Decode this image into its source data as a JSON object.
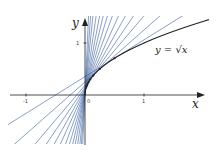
{
  "diagram": {
    "curve_label": "y = √x",
    "axis_labels": {
      "x": "x",
      "y": "y"
    },
    "ticks": {
      "x": [
        "-1",
        "0",
        "1"
      ],
      "y": [
        "1"
      ]
    },
    "colors": {
      "curve": "#222222",
      "tangent": "#3a5f9e",
      "axis": "#222222"
    },
    "tangent_points_x": [
      0.0004,
      0.001,
      0.002,
      0.004,
      0.007,
      0.011,
      0.017,
      0.026,
      0.04,
      0.06,
      0.09,
      0.14,
      0.25,
      0.5
    ]
  }
}
